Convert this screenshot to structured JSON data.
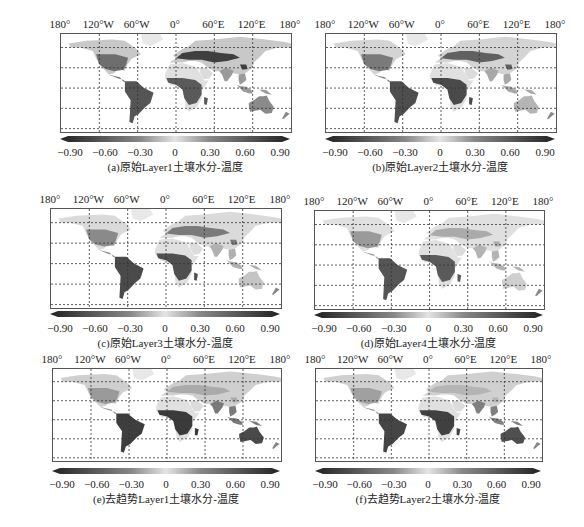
{
  "chart_data": [
    {
      "type": "heatmap",
      "id": "a",
      "title": "(a)原始Layer1土壤水分-温度",
      "xticks": [
        "180°",
        "120°W",
        "60°W",
        "0°",
        "60°E",
        "120°E",
        "180°"
      ],
      "yticks": [
        "60°N",
        "30°N",
        "0°",
        "30°S",
        "60°S"
      ],
      "colorbar": {
        "ticks": [
          "-0.90",
          "-0.60",
          "-0.30",
          "0",
          "0.30",
          "0.60",
          "0.90"
        ],
        "range": [
          -0.9,
          0.9
        ],
        "extend": "both"
      },
      "grid": true
    },
    {
      "type": "heatmap",
      "id": "b",
      "title": "(b)原始Layer2土壤水分-温度",
      "xticks": [
        "180°",
        "120°W",
        "60°W",
        "0°",
        "60°E",
        "120°E",
        "180°"
      ],
      "yticks": [
        "60°N",
        "30°N",
        "0°",
        "30°S",
        "60°S"
      ],
      "colorbar": {
        "ticks": [
          "-0.90",
          "-0.60",
          "-0.30",
          "0",
          "0.30",
          "0.60",
          "0.90"
        ],
        "range": [
          -0.9,
          0.9
        ],
        "extend": "both"
      },
      "grid": true
    },
    {
      "type": "heatmap",
      "id": "c",
      "title": "(c)原始Layer3土壤水分-温度",
      "xticks": [
        "180°",
        "120°W",
        "60°W",
        "0°",
        "60°E",
        "120°E",
        "180°"
      ],
      "yticks": [
        "60°N",
        "30°N",
        "0°",
        "30°S",
        "60°S"
      ],
      "colorbar": {
        "ticks": [
          "-0.90",
          "-0.60",
          "-0.30",
          "0",
          "0.30",
          "0.60",
          "0.90"
        ],
        "range": [
          -0.9,
          0.9
        ],
        "extend": "both"
      },
      "grid": true
    },
    {
      "type": "heatmap",
      "id": "d",
      "title": "(d)原始Layer4土壤水分-温度",
      "xticks": [
        "180°",
        "120°W",
        "60°W",
        "0°",
        "60°E",
        "120°E",
        "180°"
      ],
      "yticks": [
        "60°N",
        "30°N",
        "0°",
        "30°S",
        "60°S"
      ],
      "colorbar": {
        "ticks": [
          "-0.90",
          "-0.60",
          "-0.30",
          "0",
          "0.30",
          "0.60",
          "0.90"
        ],
        "range": [
          -0.9,
          0.9
        ],
        "extend": "both"
      },
      "grid": true
    },
    {
      "type": "heatmap",
      "id": "e",
      "title": "(e)去趋势Layer1土壤水分-温度",
      "xticks": [
        "180°",
        "120°W",
        "60°W",
        "0°",
        "60°E",
        "120°E",
        "180°"
      ],
      "yticks": [
        "60°N",
        "30°N",
        "0°",
        "30°S",
        "60°S"
      ],
      "colorbar": {
        "ticks": [
          "-0.90",
          "-0.60",
          "-0.30",
          "0",
          "0.30",
          "0.60",
          "0.90"
        ],
        "range": [
          -0.9,
          0.9
        ],
        "extend": "both"
      },
      "grid": true
    },
    {
      "type": "heatmap",
      "id": "f",
      "title": "(f)去趋势Layer2土壤水分-温度",
      "xticks": [
        "180°",
        "120°W",
        "60°W",
        "0°",
        "60°E",
        "120°E",
        "180°"
      ],
      "yticks": [
        "60°N",
        "30°N",
        "0°",
        "30°S",
        "60°S"
      ],
      "colorbar": {
        "ticks": [
          "-0.90",
          "-0.60",
          "-0.30",
          "0",
          "0.30",
          "0.60",
          "0.90"
        ],
        "range": [
          -0.9,
          0.9
        ],
        "extend": "both"
      },
      "grid": true
    }
  ],
  "panels": [
    {
      "caption": "(a)原始Layer1土壤水分-温度"
    },
    {
      "caption": "(b)原始Layer2土壤水分-温度"
    },
    {
      "caption": "(c)原始Layer3土壤水分-温度"
    },
    {
      "caption": "(d)原始Layer4土壤水分-温度"
    },
    {
      "caption": "(e)去趋势Layer1土壤水分-温度"
    },
    {
      "caption": "(f)去趋势Layer2土壤水分-温度"
    }
  ],
  "lon_labels": [
    "180°",
    "120°W",
    "60°W",
    "0°",
    "60°E",
    "120°E",
    "180°"
  ],
  "lat_labels": [
    "60°N",
    "30°N",
    "0°",
    "30°S",
    "60°S"
  ],
  "cbar_ticks": [
    "-0.90",
    "-0.60",
    "-0.30",
    "0",
    "0.30",
    "0.60",
    "0.90"
  ]
}
